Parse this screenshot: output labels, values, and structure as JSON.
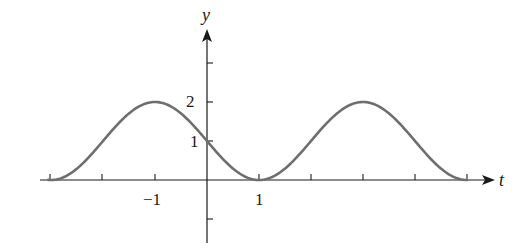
{
  "chart_data": {
    "type": "line",
    "title": "",
    "xlabel": "t",
    "ylabel": "y",
    "function": "y = 1 + cos(pi*(t+1)/2)",
    "xlim": [
      -3.1,
      5.5
    ],
    "ylim": [
      -1.6,
      3.9
    ],
    "x_ticks": [
      -3,
      -2,
      -1,
      0,
      1,
      2,
      3,
      4,
      5
    ],
    "y_ticks": [
      -1,
      1,
      2,
      3
    ],
    "x_tick_labels": [
      {
        "value": -1,
        "text": "−1"
      },
      {
        "value": 1,
        "text": "1"
      }
    ],
    "y_tick_labels": [
      {
        "value": 1,
        "text": "1"
      },
      {
        "value": 2,
        "text": "2"
      }
    ],
    "grid": false,
    "legend": null,
    "series": [
      {
        "name": "y(t)",
        "color": "#6e6e6e",
        "x": [
          -3,
          -2.5,
          -2,
          -1.5,
          -1,
          -0.5,
          0,
          0.5,
          1,
          1.5,
          2,
          2.5,
          3,
          3.5,
          4,
          4.5,
          5
        ],
        "values": [
          0,
          0.29,
          1,
          1.71,
          2,
          1.71,
          1,
          0.29,
          0,
          0.29,
          1,
          1.71,
          2,
          1.71,
          1,
          0.29,
          0
        ]
      }
    ],
    "annotations": [
      {
        "text": "maximum",
        "x": -1,
        "y": 2
      },
      {
        "text": "maximum",
        "x": 3,
        "y": 2
      },
      {
        "text": "minimum",
        "x": 1,
        "y": 0
      }
    ]
  },
  "labels": {
    "x_axis": "t",
    "y_axis": "y",
    "x_neg1": "−1",
    "x_pos1": "1",
    "y_1": "1",
    "y_2": "2"
  },
  "colors": {
    "curve": "#6e6e6e",
    "axis": "#1a1a1a"
  }
}
